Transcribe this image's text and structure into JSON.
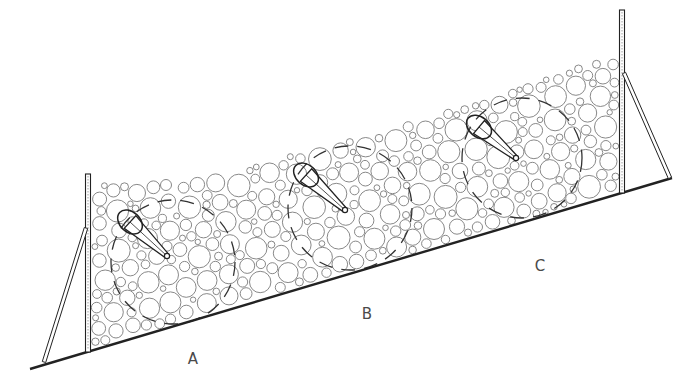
{
  "diagram": {
    "colors": {
      "background": "#ffffff",
      "line": "#222222",
      "particle_stroke": "#7a7a7a",
      "dashed_zone": "#333333",
      "label": "#4a4a4a"
    },
    "ground_line": {
      "x1": 30,
      "y1": 369,
      "x2": 672,
      "y2": 178
    },
    "posts": [
      {
        "id": "left",
        "x": 88,
        "top": 174,
        "bottom": 352,
        "brace": {
          "x1": 86,
          "y1": 228,
          "x2": 44,
          "y2": 362
        }
      },
      {
        "id": "right",
        "x": 622,
        "top": 10,
        "bottom": 193,
        "brace": {
          "x1": 624,
          "y1": 73,
          "x2": 670,
          "y2": 178
        }
      }
    ],
    "fill_top_edge": [
      [
        92,
        183
      ],
      [
        160,
        180
      ],
      [
        230,
        172
      ],
      [
        300,
        150
      ],
      [
        380,
        130
      ],
      [
        450,
        108
      ],
      [
        520,
        85
      ],
      [
        580,
        64
      ],
      [
        618,
        55
      ]
    ],
    "zones": [
      {
        "label": "A",
        "label_x": 193,
        "label_y": 364,
        "cx": 173,
        "cy": 262,
        "r": 62,
        "probe": {
          "hx": 130,
          "hy": 222,
          "hrx": 14,
          "hry": 10,
          "tx": 167,
          "ty": 256
        }
      },
      {
        "label": "B",
        "label_x": 367,
        "label_y": 319,
        "cx": 350,
        "cy": 208,
        "r": 62,
        "probe": {
          "hx": 306,
          "hy": 175,
          "hrx": 14,
          "hry": 10,
          "tx": 345,
          "ty": 210
        }
      },
      {
        "label": "C",
        "label_x": 540,
        "label_y": 271,
        "cx": 522,
        "cy": 158,
        "r": 60,
        "probe": {
          "hx": 479,
          "hy": 127,
          "hrx": 14,
          "hry": 10,
          "tx": 516,
          "ty": 158
        }
      }
    ]
  }
}
